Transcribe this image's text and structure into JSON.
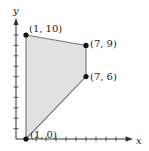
{
  "chart_data": {
    "type": "area",
    "title": "",
    "xlabel": "x",
    "ylabel": "y",
    "xlim": [
      0,
      11
    ],
    "ylim": [
      0,
      10
    ],
    "grid": false,
    "legend": null,
    "x_ticks": [
      1,
      2,
      3,
      4,
      5,
      6,
      7,
      8,
      9,
      10,
      11
    ],
    "y_ticks": [
      1,
      2,
      3,
      4,
      5,
      6,
      7,
      8,
      9,
      10
    ],
    "tick_labels_shown": false,
    "series": [
      {
        "name": "feasible region",
        "shape": "polygon",
        "vertices": [
          {
            "x": 1,
            "y": 10,
            "label": "(1, 10)"
          },
          {
            "x": 7,
            "y": 9,
            "label": "(7, 9)"
          },
          {
            "x": 7,
            "y": 6,
            "label": "(7, 6)"
          },
          {
            "x": 1,
            "y": 0,
            "label": "(1, 0)"
          }
        ]
      }
    ],
    "annotations": [
      "(1, 10)",
      "(7, 9)",
      "(7, 6)",
      "(1, 0)"
    ]
  },
  "style": {
    "fill_color": "#e1e1e1",
    "edge_color": "#7a7a7a",
    "axis_color": "#333333",
    "point_color": "#111111"
  }
}
